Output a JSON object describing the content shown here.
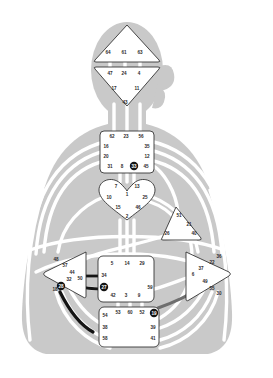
{
  "document": {
    "title": "Human Design Bodygraph",
    "type": "bodygraph-chart"
  },
  "colors": {
    "body_silhouette": "#c9c9c9",
    "center_fill": "#ffffff",
    "center_stroke": "#2b2b2b",
    "channel_undefined": "#ffffff",
    "channel_defined": "#141414",
    "channel_defined_soft": "#6e6e6e",
    "gate_text": "#2b2b2b",
    "gate_text_activated": "#ffffff",
    "background": "#ffffff"
  },
  "centers": [
    {
      "id": "head",
      "name": "Head Center",
      "shape": "triangle-up",
      "defined": false,
      "gates": [
        {
          "number": "64",
          "x": 108,
          "y": 52,
          "activated": false
        },
        {
          "number": "61",
          "x": 124,
          "y": 52,
          "activated": false
        },
        {
          "number": "63",
          "x": 140,
          "y": 52,
          "activated": false
        }
      ]
    },
    {
      "id": "ajna",
      "name": "Ajna Center",
      "shape": "triangle-down",
      "defined": false,
      "gates": [
        {
          "number": "47",
          "x": 110,
          "y": 73,
          "activated": false
        },
        {
          "number": "24",
          "x": 124,
          "y": 73,
          "activated": false
        },
        {
          "number": "4",
          "x": 139,
          "y": 73,
          "activated": false
        },
        {
          "number": "17",
          "x": 114,
          "y": 88,
          "activated": false
        },
        {
          "number": "11",
          "x": 137,
          "y": 88,
          "activated": false
        },
        {
          "number": "43",
          "x": 125,
          "y": 102,
          "activated": false
        }
      ]
    },
    {
      "id": "throat",
      "name": "Throat Center",
      "shape": "square",
      "defined": false,
      "gates": [
        {
          "number": "62",
          "x": 112,
          "y": 136,
          "activated": false
        },
        {
          "number": "23",
          "x": 126,
          "y": 136,
          "activated": false
        },
        {
          "number": "56",
          "x": 141,
          "y": 136,
          "activated": false
        },
        {
          "number": "16",
          "x": 106,
          "y": 146,
          "activated": false
        },
        {
          "number": "35",
          "x": 147,
          "y": 146,
          "activated": false
        },
        {
          "number": "20",
          "x": 106,
          "y": 156,
          "activated": false
        },
        {
          "number": "12",
          "x": 147,
          "y": 156,
          "activated": false
        },
        {
          "number": "31",
          "x": 110,
          "y": 166,
          "activated": false
        },
        {
          "number": "8",
          "x": 122,
          "y": 166,
          "activated": false
        },
        {
          "number": "33",
          "x": 134,
          "y": 166,
          "activated": true
        },
        {
          "number": "45",
          "x": 146,
          "y": 166,
          "activated": false
        }
      ]
    },
    {
      "id": "g",
      "name": "G Center",
      "shape": "heart",
      "defined": false,
      "gates": [
        {
          "number": "7",
          "x": 116,
          "y": 186,
          "activated": false
        },
        {
          "number": "13",
          "x": 137,
          "y": 186,
          "activated": false
        },
        {
          "number": "1",
          "x": 127,
          "y": 194,
          "activated": false
        },
        {
          "number": "10",
          "x": 109,
          "y": 197,
          "activated": false
        },
        {
          "number": "25",
          "x": 145,
          "y": 197,
          "activated": false
        },
        {
          "number": "15",
          "x": 118,
          "y": 207,
          "activated": false
        },
        {
          "number": "46",
          "x": 138,
          "y": 207,
          "activated": false
        },
        {
          "number": "2",
          "x": 127,
          "y": 216,
          "activated": false
        }
      ]
    },
    {
      "id": "ego",
      "name": "Ego / Will Center",
      "shape": "triangle-right",
      "defined": false,
      "gates": [
        {
          "number": "51",
          "x": 179,
          "y": 215,
          "activated": false
        },
        {
          "number": "21",
          "x": 189,
          "y": 224,
          "activated": false
        },
        {
          "number": "26",
          "x": 167,
          "y": 233,
          "activated": false
        },
        {
          "number": "40",
          "x": 194,
          "y": 233,
          "activated": false
        }
      ]
    },
    {
      "id": "spleen",
      "name": "Spleen Center",
      "shape": "triangle-left",
      "defined": false,
      "gates": [
        {
          "number": "48",
          "x": 56,
          "y": 259,
          "activated": false
        },
        {
          "number": "57",
          "x": 65,
          "y": 265,
          "activated": false
        },
        {
          "number": "44",
          "x": 72,
          "y": 272,
          "activated": false
        },
        {
          "number": "50",
          "x": 80,
          "y": 278,
          "activated": false
        },
        {
          "number": "32",
          "x": 69,
          "y": 279,
          "activated": false
        },
        {
          "number": "28",
          "x": 61,
          "y": 286,
          "activated": true
        },
        {
          "number": "18",
          "x": 55,
          "y": 289,
          "activated": false
        }
      ]
    },
    {
      "id": "solar-plexus",
      "name": "Solar Plexus Center",
      "shape": "triangle-right",
      "defined": false,
      "gates": [
        {
          "number": "36",
          "x": 219,
          "y": 256,
          "activated": false
        },
        {
          "number": "22",
          "x": 212,
          "y": 262,
          "activated": false
        },
        {
          "number": "37",
          "x": 201,
          "y": 268,
          "activated": false
        },
        {
          "number": "6",
          "x": 193,
          "y": 274,
          "activated": false
        },
        {
          "number": "49",
          "x": 205,
          "y": 281,
          "activated": false
        },
        {
          "number": "55",
          "x": 212,
          "y": 288,
          "activated": false
        },
        {
          "number": "30",
          "x": 219,
          "y": 293,
          "activated": false
        }
      ]
    },
    {
      "id": "sacral",
      "name": "Sacral Center",
      "shape": "square",
      "defined": false,
      "gates": [
        {
          "number": "5",
          "x": 112,
          "y": 263,
          "activated": false
        },
        {
          "number": "14",
          "x": 127,
          "y": 263,
          "activated": false
        },
        {
          "number": "29",
          "x": 142,
          "y": 263,
          "activated": false
        },
        {
          "number": "34",
          "x": 104,
          "y": 275,
          "activated": false
        },
        {
          "number": "27",
          "x": 104,
          "y": 287,
          "activated": true
        },
        {
          "number": "59",
          "x": 150,
          "y": 287,
          "activated": false
        },
        {
          "number": "42",
          "x": 113,
          "y": 295,
          "activated": false
        },
        {
          "number": "3",
          "x": 126,
          "y": 295,
          "activated": false
        },
        {
          "number": "9",
          "x": 139,
          "y": 295,
          "activated": false
        }
      ]
    },
    {
      "id": "root",
      "name": "Root Center",
      "shape": "square",
      "defined": false,
      "gates": [
        {
          "number": "53",
          "x": 118,
          "y": 312,
          "activated": false
        },
        {
          "number": "60",
          "x": 130,
          "y": 312,
          "activated": false
        },
        {
          "number": "52",
          "x": 142,
          "y": 312,
          "activated": false
        },
        {
          "number": "19",
          "x": 154,
          "y": 313,
          "activated": true
        },
        {
          "number": "54",
          "x": 105,
          "y": 315,
          "activated": false
        },
        {
          "number": "38",
          "x": 105,
          "y": 327,
          "activated": false
        },
        {
          "number": "39",
          "x": 153,
          "y": 327,
          "activated": false
        },
        {
          "number": "58",
          "x": 105,
          "y": 338,
          "activated": false
        },
        {
          "number": "41",
          "x": 153,
          "y": 338,
          "activated": false
        }
      ]
    }
  ],
  "defined_channels": [
    {
      "id": "ch-28-38",
      "from": "28",
      "to": "38",
      "color": "#141414"
    },
    {
      "id": "ch-34-57",
      "from": "34",
      "to": "57",
      "color": "#141414"
    },
    {
      "id": "ch-27-50",
      "from": "27",
      "to": "50",
      "color": "#141414"
    },
    {
      "id": "ch-19-49",
      "from": "19",
      "to": "49",
      "color": "#6e6e6e"
    }
  ],
  "chart_data": {
    "type": "diagram",
    "centers_count": 9,
    "gates_total": 64,
    "activated_gates": [
      "33",
      "28",
      "27",
      "19"
    ],
    "legend": []
  }
}
